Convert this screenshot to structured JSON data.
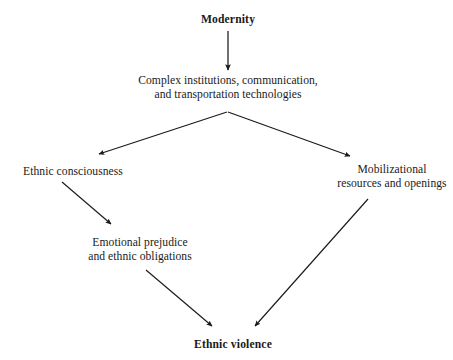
{
  "diagram": {
    "title_node": "Modernity",
    "background_color": "#ffffff",
    "stroke_color": "#1a1a1a",
    "nodes": [
      {
        "id": "modernity",
        "lines": [
          "Modernity"
        ],
        "emphasis": "bold"
      },
      {
        "id": "complex-institutions",
        "lines": [
          "Complex institutions, communication,",
          "and transportation technologies"
        ],
        "emphasis": "normal"
      },
      {
        "id": "ethnic-consciousness",
        "lines": [
          "Ethnic consciousness"
        ],
        "emphasis": "normal"
      },
      {
        "id": "mobilizational-resources",
        "lines": [
          "Mobilizational",
          "resources and openings"
        ],
        "emphasis": "normal"
      },
      {
        "id": "emotional-prejudice",
        "lines": [
          "Emotional prejudice",
          "and ethnic obligations"
        ],
        "emphasis": "normal"
      },
      {
        "id": "ethnic-violence",
        "lines": [
          "Ethnic violence"
        ],
        "emphasis": "bold"
      }
    ],
    "edges": [
      {
        "id": "modernity-to-complex",
        "from": "modernity",
        "to": "complex-institutions"
      },
      {
        "id": "complex-to-ethnic-consciousness",
        "from": "complex-institutions",
        "to": "ethnic-consciousness"
      },
      {
        "id": "complex-to-mobilizational",
        "from": "complex-institutions",
        "to": "mobilizational-resources"
      },
      {
        "id": "ethnic-consciousness-to-emotional",
        "from": "ethnic-consciousness",
        "to": "emotional-prejudice"
      },
      {
        "id": "emotional-to-ethnic-violence",
        "from": "emotional-prejudice",
        "to": "ethnic-violence"
      },
      {
        "id": "mobilizational-to-ethnic-violence",
        "from": "mobilizational-resources",
        "to": "ethnic-violence"
      }
    ]
  }
}
